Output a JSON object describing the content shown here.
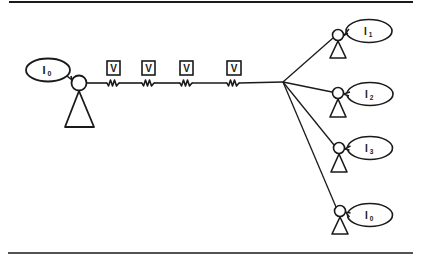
{
  "diagram": {
    "width": 425,
    "height": 259,
    "ink_color": "#1a1a1a",
    "background": "#ffffff",
    "rules": {
      "top": {
        "x1": 9,
        "x2": 413,
        "y": 2,
        "width": 2
      },
      "bottom": {
        "x1": 8,
        "x2": 413,
        "y": 253,
        "width": 1.6
      }
    },
    "source": {
      "label": "I",
      "subscript": "0",
      "head": {
        "cx": 79,
        "cy": 83,
        "r": 7.5
      },
      "body": {
        "apex": [
          79,
          91
        ],
        "left": [
          65,
          127
        ],
        "right": [
          94,
          127
        ]
      },
      "bubble": {
        "cx": 48,
        "cy": 70,
        "rx": 22,
        "ry": 11.5,
        "tail": [
          [
            67,
            76
          ],
          [
            72,
            80
          ],
          [
            71,
            76
          ]
        ]
      }
    },
    "wire": {
      "start": [
        86,
        83
      ],
      "junction": [
        283,
        82
      ],
      "voltage_label": "V",
      "resistors": [
        {
          "x": 107,
          "box": [
            107,
            61,
            13,
            14
          ]
        },
        {
          "x": 142,
          "box": [
            142,
            61,
            13,
            14
          ]
        },
        {
          "x": 180,
          "box": [
            180,
            61,
            13,
            14
          ]
        },
        {
          "x": 227,
          "box": [
            227,
            61,
            14,
            14
          ]
        }
      ]
    },
    "receivers": [
      {
        "label": "I",
        "subscript": "1",
        "head": {
          "cx": 338,
          "cy": 35,
          "r": 5.5
        },
        "body": {
          "apex": [
            338,
            41
          ],
          "left": [
            330,
            58
          ],
          "right": [
            346,
            58
          ]
        },
        "bubble": {
          "cx": 369,
          "cy": 31,
          "rx": 23,
          "ry": 11.5
        },
        "line_end": [
          333,
          38
        ]
      },
      {
        "label": "I",
        "subscript": "2",
        "head": {
          "cx": 338,
          "cy": 93,
          "r": 5.5
        },
        "body": {
          "apex": [
            338,
            99
          ],
          "left": [
            330,
            117
          ],
          "right": [
            346,
            117
          ]
        },
        "bubble": {
          "cx": 370,
          "cy": 94,
          "rx": 23,
          "ry": 11.5
        },
        "line_end": [
          332,
          92
        ]
      },
      {
        "label": "I",
        "subscript": "3",
        "head": {
          "cx": 339,
          "cy": 148,
          "r": 5.5
        },
        "body": {
          "apex": [
            339,
            154
          ],
          "left": [
            331,
            172
          ],
          "right": [
            347,
            172
          ]
        },
        "bubble": {
          "cx": 370,
          "cy": 148,
          "rx": 22.5,
          "ry": 11.5
        },
        "line_end": [
          334,
          145
        ]
      },
      {
        "label": "I",
        "subscript": "0",
        "head": {
          "cx": 340,
          "cy": 211,
          "r": 5.5
        },
        "body": {
          "apex": [
            340,
            217
          ],
          "left": [
            332,
            234
          ],
          "right": [
            348,
            234
          ]
        },
        "bubble": {
          "cx": 370,
          "cy": 215,
          "rx": 22.5,
          "ry": 11.5
        },
        "line_end": [
          336,
          207
        ]
      }
    ]
  }
}
